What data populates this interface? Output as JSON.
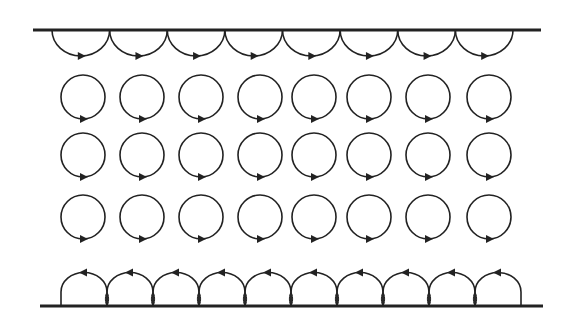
{
  "diagram": {
    "stroke_color": "#222222",
    "top_wall": {
      "x1": 33,
      "x2": 541,
      "y": 30
    },
    "bottom_wall": {
      "x1": 40,
      "x2": 543,
      "y": 306
    },
    "top_arcs": {
      "count": 8,
      "start_x": 52,
      "end_x": 513,
      "y": 30,
      "direction": "clockwise-arrow-right"
    },
    "bottom_arcs": {
      "count": 10,
      "start_x": 61,
      "end_x": 521,
      "y": 306,
      "direction": "arrow-left"
    },
    "circle_rows": {
      "centers_x": [
        83,
        142,
        201,
        260,
        314,
        369,
        428,
        489
      ],
      "centers_y": [
        97,
        155,
        217
      ],
      "radius": 22,
      "arrow": "clockwise at bottom"
    }
  }
}
